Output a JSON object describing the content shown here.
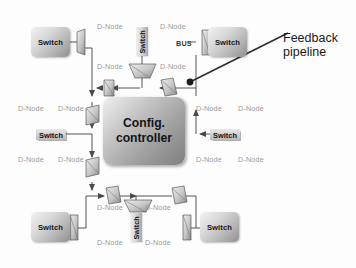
{
  "diagram": {
    "controller": {
      "line1": "Config.",
      "line2": "controller"
    },
    "annotations": [
      {
        "id": "feedback-pipeline",
        "line1": "Feedback",
        "line2": "pipeline",
        "x": 283,
        "y": 31
      }
    ],
    "bus_label": {
      "text": "BUS",
      "x": 176,
      "y": 39
    },
    "dnode_label": "D-Node",
    "dnode_labels": [
      {
        "x": 97,
        "y": 22
      },
      {
        "x": 160,
        "y": 22
      },
      {
        "x": 97,
        "y": 62
      },
      {
        "x": 160,
        "y": 62
      },
      {
        "x": 18,
        "y": 104
      },
      {
        "x": 58,
        "y": 104
      },
      {
        "x": 196,
        "y": 104
      },
      {
        "x": 238,
        "y": 104
      },
      {
        "x": 18,
        "y": 155
      },
      {
        "x": 58,
        "y": 155
      },
      {
        "x": 196,
        "y": 155
      },
      {
        "x": 238,
        "y": 155
      },
      {
        "x": 97,
        "y": 203
      },
      {
        "x": 145,
        "y": 203
      },
      {
        "x": 97,
        "y": 238
      },
      {
        "x": 145,
        "y": 238
      }
    ],
    "switches": [
      {
        "name": "switch-top-left",
        "label": "Switch",
        "style": "box",
        "x": 31,
        "y": 27,
        "w": 39,
        "h": 30
      },
      {
        "name": "switch-top-center",
        "label": "Switch",
        "style": "vert",
        "x": 136,
        "y": 27,
        "w": 12,
        "h": 29
      },
      {
        "name": "switch-top-right",
        "label": "Switch",
        "style": "box",
        "x": 208,
        "y": 27,
        "w": 39,
        "h": 30
      },
      {
        "name": "switch-left-middle",
        "label": "Switch",
        "style": "flat",
        "x": 36,
        "y": 129,
        "w": 30,
        "h": 11
      },
      {
        "name": "switch-right-middle",
        "label": "Switch",
        "style": "flat",
        "x": 210,
        "y": 129,
        "w": 30,
        "h": 11
      },
      {
        "name": "switch-bottom-left",
        "label": "Switch",
        "style": "box",
        "x": 31,
        "y": 212,
        "w": 39,
        "h": 30
      },
      {
        "name": "switch-bottom-center",
        "label": "Switch",
        "style": "vert",
        "x": 130,
        "y": 213,
        "w": 12,
        "h": 29
      },
      {
        "name": "switch-bottom-right",
        "label": "Switch",
        "style": "box",
        "x": 200,
        "y": 212,
        "w": 39,
        "h": 30
      }
    ],
    "colors": {
      "line": "#555555",
      "dnode_text": "#9a9a9a",
      "annotation_text": "#1a1a1a",
      "node_fill": "#bfbfbf",
      "background": "#fdfdfd"
    }
  }
}
